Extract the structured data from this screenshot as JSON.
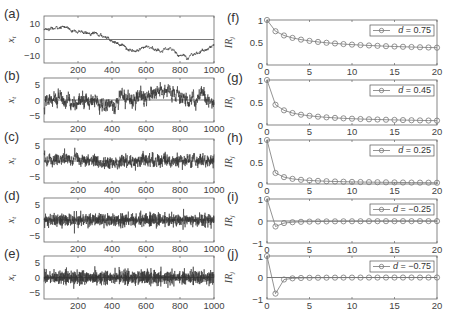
{
  "chart_data": [
    {
      "panel": "(a)",
      "type": "line",
      "ylabel": "x_t",
      "xlim": [
        0,
        1000
      ],
      "ylim": [
        -15,
        15
      ],
      "xticks": [
        200,
        400,
        600,
        800,
        1000
      ],
      "yticks": [
        10,
        0,
        -10
      ],
      "zero_line": true,
      "d": 0.75,
      "description": "simulated fractionally integrated series, n=1000; starts near 10, drifts down to about -8 near t=800, returns near 0 at t=1000"
    },
    {
      "panel": "(b)",
      "type": "line",
      "ylabel": "x_t",
      "xlim": [
        0,
        1000
      ],
      "ylim": [
        -7,
        7
      ],
      "xticks": [
        200,
        400,
        600,
        800,
        1000
      ],
      "yticks": [
        5,
        0,
        -5
      ],
      "zero_line": true,
      "d": 0.45,
      "description": "simulated series, n=1000; initial spike near 4, fluctuates around 0 within about ±4"
    },
    {
      "panel": "(c)",
      "type": "line",
      "ylabel": "x_t",
      "xlim": [
        0,
        1000
      ],
      "ylim": [
        -7,
        7
      ],
      "xticks": [
        200,
        400,
        600,
        800,
        1000
      ],
      "yticks": [
        5,
        0,
        -5
      ],
      "zero_line": true,
      "d": 0.25,
      "description": "simulated series, n=1000; fluctuates around 0 within about ±3"
    },
    {
      "panel": "(d)",
      "type": "line",
      "ylabel": "x_t",
      "xlim": [
        0,
        1000
      ],
      "ylim": [
        -7,
        7
      ],
      "xticks": [
        200,
        400,
        600,
        800,
        1000
      ],
      "yticks": [
        5,
        0,
        -5
      ],
      "zero_line": true,
      "d": -0.25,
      "description": "simulated anti-persistent series, n=1000; rapid oscillation within about ±3"
    },
    {
      "panel": "(e)",
      "type": "line",
      "ylabel": "x_t",
      "xlim": [
        0,
        1000
      ],
      "ylim": [
        -7,
        7
      ],
      "xticks": [
        200,
        400,
        600,
        800,
        1000
      ],
      "yticks": [
        5,
        0,
        -5
      ],
      "zero_line": true,
      "d": -0.75,
      "description": "simulated strongly anti-persistent series, n=1000; rapid oscillation within about ±4, occasional spike near 5"
    },
    {
      "panel": "(f)",
      "type": "line",
      "ylabel": "IR_j",
      "xlim": [
        0,
        20
      ],
      "ylim": [
        0,
        1
      ],
      "xticks": [
        0,
        5,
        10,
        15,
        20
      ],
      "yticks": [
        1,
        0.5,
        0
      ],
      "legend": "d = 0.75",
      "marker": "circle",
      "x": [
        0,
        1,
        2,
        3,
        4,
        5,
        6,
        7,
        8,
        9,
        10,
        11,
        12,
        13,
        14,
        15,
        16,
        17,
        18,
        19,
        20
      ],
      "values": [
        1,
        0.75,
        0.656,
        0.602,
        0.564,
        0.536,
        0.513,
        0.494,
        0.479,
        0.465,
        0.453,
        0.443,
        0.434,
        0.426,
        0.418,
        0.411,
        0.405,
        0.4,
        0.394,
        0.389,
        0.385
      ]
    },
    {
      "panel": "(g)",
      "type": "line",
      "ylabel": "IR_j",
      "xlim": [
        0,
        20
      ],
      "ylim": [
        0,
        1
      ],
      "xticks": [
        0,
        5,
        10,
        15,
        20
      ],
      "yticks": [
        1,
        0.5,
        0
      ],
      "legend": "d = 0.45",
      "marker": "circle",
      "x": [
        0,
        1,
        2,
        3,
        4,
        5,
        6,
        7,
        8,
        9,
        10,
        11,
        12,
        13,
        14,
        15,
        16,
        17,
        18,
        19,
        20
      ],
      "values": [
        1,
        0.45,
        0.326,
        0.266,
        0.229,
        0.204,
        0.185,
        0.17,
        0.158,
        0.148,
        0.14,
        0.133,
        0.127,
        0.122,
        0.117,
        0.113,
        0.109,
        0.106,
        0.102,
        0.099,
        0.097
      ]
    },
    {
      "panel": "(h)",
      "type": "line",
      "ylabel": "IR_j",
      "xlim": [
        0,
        20
      ],
      "ylim": [
        0,
        1
      ],
      "xticks": [
        0,
        5,
        10,
        15,
        20
      ],
      "yticks": [
        1,
        0.5,
        0
      ],
      "legend": "d = 0.25",
      "marker": "circle",
      "x": [
        0,
        1,
        2,
        3,
        4,
        5,
        6,
        7,
        8,
        9,
        10,
        11,
        12,
        13,
        14,
        15,
        16,
        17,
        18,
        19,
        20
      ],
      "values": [
        1,
        0.25,
        0.156,
        0.117,
        0.095,
        0.081,
        0.071,
        0.063,
        0.057,
        0.052,
        0.048,
        0.045,
        0.042,
        0.04,
        0.038,
        0.036,
        0.034,
        0.032,
        0.031,
        0.03,
        0.028
      ]
    },
    {
      "panel": "(i)",
      "type": "line",
      "ylabel": "IR_j",
      "xlim": [
        0,
        20
      ],
      "ylim": [
        -1,
        1
      ],
      "xticks": [
        0,
        5,
        10,
        15,
        20
      ],
      "yticks": [
        1,
        0,
        -1
      ],
      "legend": "d = −0.25",
      "marker": "circle",
      "zero_line": true,
      "x": [
        0,
        1,
        2,
        3,
        4,
        5,
        6,
        7,
        8,
        9,
        10,
        11,
        12,
        13,
        14,
        15,
        16,
        17,
        18,
        19,
        20
      ],
      "values": [
        1,
        -0.25,
        -0.094,
        -0.055,
        -0.038,
        -0.029,
        -0.023,
        -0.019,
        -0.016,
        -0.014,
        -0.012,
        -0.011,
        -0.01,
        -0.009,
        -0.008,
        -0.008,
        -0.007,
        -0.007,
        -0.006,
        -0.006,
        -0.006
      ]
    },
    {
      "panel": "(j)",
      "type": "line",
      "ylabel": "IR_j",
      "xlim": [
        0,
        20
      ],
      "ylim": [
        -1,
        1
      ],
      "xticks": [
        0,
        5,
        10,
        15,
        20
      ],
      "yticks": [
        1,
        0,
        -1
      ],
      "legend": "d = −0.75",
      "marker": "circle",
      "zero_line": true,
      "x": [
        0,
        1,
        2,
        3,
        4,
        5,
        6,
        7,
        8,
        9,
        10,
        11,
        12,
        13,
        14,
        15,
        16,
        17,
        18,
        19,
        20
      ],
      "values": [
        1,
        -0.75,
        -0.094,
        -0.039,
        -0.022,
        -0.015,
        -0.011,
        -0.008,
        -0.006,
        -0.005,
        -0.004,
        -0.004,
        -0.003,
        -0.003,
        -0.002,
        -0.002,
        -0.002,
        -0.002,
        -0.002,
        -0.001,
        -0.001
      ]
    }
  ],
  "style": {
    "series_color": "#333333",
    "ir_color": "#777777",
    "axis_color": "#666666",
    "background": "#ffffff"
  }
}
